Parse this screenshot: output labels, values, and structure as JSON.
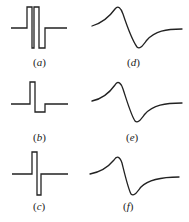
{
  "figure": {
    "panels": [
      {
        "id": "a",
        "label": "(a)",
        "letter": "a",
        "kind": "pulse-sequence",
        "description": "two bipolar pulse pairs"
      },
      {
        "id": "b",
        "label": "(b)",
        "letter": "b",
        "kind": "pulse-sequence",
        "description": "positive pulse followed by shallow negative lobe"
      },
      {
        "id": "c",
        "label": "(c)",
        "letter": "c",
        "kind": "pulse-sequence",
        "description": "narrow bipolar pulse"
      },
      {
        "id": "d",
        "label": "(d)",
        "letter": "d",
        "kind": "response-curve",
        "description": "bipolar response waveform"
      },
      {
        "id": "e",
        "label": "(e)",
        "letter": "e",
        "kind": "response-curve",
        "description": "bipolar response waveform"
      },
      {
        "id": "f",
        "label": "(f)",
        "letter": "f",
        "kind": "response-curve",
        "description": "bipolar response waveform"
      }
    ],
    "colors": {
      "stroke": "#222222",
      "background": "#ffffff"
    }
  }
}
